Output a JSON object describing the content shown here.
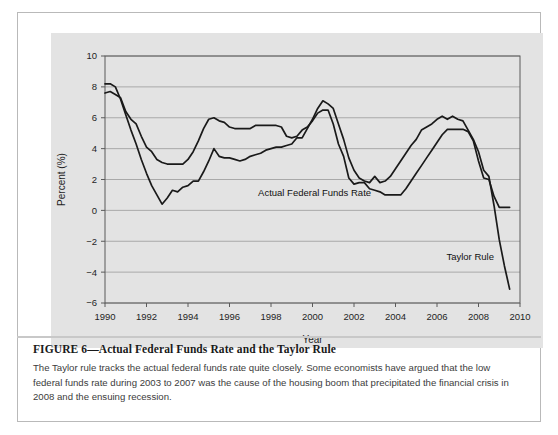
{
  "figure": {
    "title_label": "FIGURE 6—Actual Federal Funds Rate and the Taylor Rule",
    "caption": "The Taylor rule tracks the actual federal funds rate quite closely. Some economists have argued that the low federal funds rate during 2003 to 2007 was the cause of the housing boom that precipitated the financial crisis in 2008 and the ensuing recession."
  },
  "chart_data": {
    "type": "line",
    "title": "",
    "xlabel": "Year",
    "ylabel": "Percent (%)",
    "xlim": [
      1990,
      2010
    ],
    "ylim": [
      -6,
      10
    ],
    "xticks": [
      1990,
      1992,
      1994,
      1996,
      1998,
      2000,
      2002,
      2004,
      2006,
      2008,
      2010
    ],
    "yticks": [
      10,
      8,
      6,
      4,
      2,
      0,
      -2,
      -4,
      -6
    ],
    "xtick_labels": [
      "1990",
      "1992",
      "1994",
      "1996",
      "1998",
      "2000",
      "2002",
      "2004",
      "2006",
      "2008",
      "2010"
    ],
    "ytick_labels": [
      "10",
      "8",
      "6",
      "4",
      "2",
      "0",
      "-2",
      "-4",
      "-6"
    ],
    "grid": true,
    "legend_position": "inline-annotation",
    "annotations": [
      {
        "name": "actual-federal-funds-rate-label",
        "text": "Actual Federal Funds Rate",
        "x": 2000.1,
        "y": 0.9
      },
      {
        "name": "taylor-rule-label",
        "text": "Taylor Rule",
        "x": 2007.6,
        "y": -3.2
      }
    ],
    "colors": {
      "line": "#1a1a1a",
      "panel": "#e3e3e3",
      "grid": "#9a9a9a"
    },
    "series": [
      {
        "name": "Actual Federal Funds Rate",
        "x": [
          1990.0,
          1990.25,
          1990.5,
          1990.75,
          1991.0,
          1991.25,
          1991.5,
          1991.75,
          1992.0,
          1992.25,
          1992.5,
          1992.75,
          1993.0,
          1993.25,
          1993.5,
          1993.75,
          1994.0,
          1994.25,
          1994.5,
          1994.75,
          1995.0,
          1995.25,
          1995.5,
          1995.75,
          1996.0,
          1996.25,
          1996.5,
          1996.75,
          1997.0,
          1997.25,
          1997.5,
          1997.75,
          1998.0,
          1998.25,
          1998.5,
          1998.75,
          1999.0,
          1999.25,
          1999.5,
          1999.75,
          2000.0,
          2000.25,
          2000.5,
          2000.75,
          2001.0,
          2001.25,
          2001.5,
          2001.75,
          2002.0,
          2002.25,
          2002.5,
          2002.75,
          2003.0,
          2003.25,
          2003.5,
          2003.75,
          2004.0,
          2004.25,
          2004.5,
          2004.75,
          2005.0,
          2005.25,
          2005.5,
          2005.75,
          2006.0,
          2006.25,
          2006.5,
          2006.75,
          2007.0,
          2007.25,
          2007.5,
          2007.75,
          2008.0,
          2008.25,
          2008.5,
          2008.75,
          2009.0,
          2009.25,
          2009.5
        ],
        "values": [
          7.6,
          7.7,
          7.5,
          7.3,
          6.4,
          5.9,
          5.6,
          4.8,
          4.1,
          3.8,
          3.3,
          3.1,
          3.0,
          3.0,
          3.0,
          3.0,
          3.3,
          3.8,
          4.5,
          5.3,
          5.9,
          6.0,
          5.8,
          5.7,
          5.4,
          5.3,
          5.3,
          5.3,
          5.3,
          5.5,
          5.5,
          5.5,
          5.5,
          5.5,
          5.4,
          4.8,
          4.7,
          4.8,
          5.2,
          5.4,
          5.8,
          6.3,
          6.5,
          6.5,
          5.6,
          4.3,
          3.5,
          2.1,
          1.7,
          1.8,
          1.8,
          1.4,
          1.3,
          1.2,
          1.0,
          1.0,
          1.0,
          1.0,
          1.4,
          1.9,
          2.4,
          2.9,
          3.4,
          3.9,
          4.4,
          4.9,
          5.25,
          5.25,
          5.25,
          5.25,
          5.1,
          4.5,
          3.2,
          2.1,
          2.0,
          0.9,
          0.2,
          0.2,
          0.2
        ]
      },
      {
        "name": "Taylor Rule",
        "x": [
          1990.0,
          1990.25,
          1990.5,
          1990.75,
          1991.0,
          1991.25,
          1991.5,
          1991.75,
          1992.0,
          1992.25,
          1992.5,
          1992.75,
          1993.0,
          1993.25,
          1993.5,
          1993.75,
          1994.0,
          1994.25,
          1994.5,
          1994.75,
          1995.0,
          1995.25,
          1995.5,
          1995.75,
          1996.0,
          1996.25,
          1996.5,
          1996.75,
          1997.0,
          1997.25,
          1997.5,
          1997.75,
          1998.0,
          1998.25,
          1998.5,
          1998.75,
          1999.0,
          1999.25,
          1999.5,
          1999.75,
          2000.0,
          2000.25,
          2000.5,
          2000.75,
          2001.0,
          2001.25,
          2001.5,
          2001.75,
          2002.0,
          2002.25,
          2002.5,
          2002.75,
          2003.0,
          2003.25,
          2003.5,
          2003.75,
          2004.0,
          2004.25,
          2004.5,
          2004.75,
          2005.0,
          2005.25,
          2005.5,
          2005.75,
          2006.0,
          2006.25,
          2006.5,
          2006.75,
          2007.0,
          2007.25,
          2007.5,
          2007.75,
          2008.0,
          2008.25,
          2008.5,
          2008.75,
          2009.0,
          2009.25,
          2009.5
        ],
        "values": [
          8.2,
          8.2,
          8.0,
          7.2,
          6.2,
          5.2,
          4.3,
          3.3,
          2.4,
          1.6,
          1.0,
          0.4,
          0.8,
          1.3,
          1.2,
          1.5,
          1.6,
          1.9,
          1.9,
          2.5,
          3.2,
          4.0,
          3.5,
          3.4,
          3.4,
          3.3,
          3.2,
          3.3,
          3.5,
          3.6,
          3.7,
          3.9,
          4.0,
          4.1,
          4.1,
          4.2,
          4.3,
          4.7,
          4.7,
          5.3,
          5.9,
          6.6,
          7.1,
          6.9,
          6.6,
          5.6,
          4.6,
          3.4,
          2.6,
          2.1,
          1.9,
          1.8,
          2.2,
          1.8,
          1.9,
          2.2,
          2.7,
          3.2,
          3.7,
          4.2,
          4.6,
          5.2,
          5.4,
          5.6,
          5.9,
          6.1,
          5.9,
          6.1,
          5.9,
          5.8,
          5.2,
          4.6,
          3.8,
          2.6,
          2.2,
          0.3,
          -1.9,
          -3.6,
          -5.1
        ]
      }
    ]
  }
}
